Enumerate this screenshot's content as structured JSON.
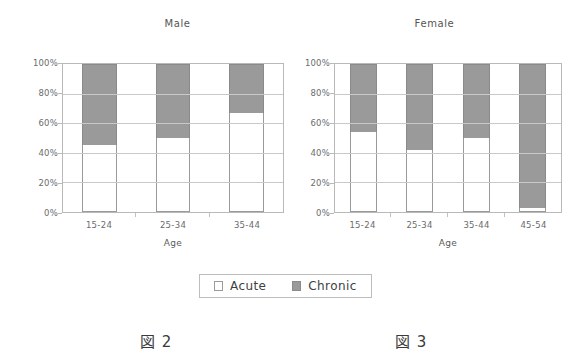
{
  "figure": {
    "captions": [
      {
        "id": "fig2",
        "text": "図 2"
      },
      {
        "id": "fig3",
        "text": "図 3"
      }
    ]
  },
  "legend": {
    "items": [
      {
        "label": "Acute",
        "color": "#ffffff",
        "swatch": "acute-swatch"
      },
      {
        "label": "Chronic",
        "color": "#9a9a9a",
        "swatch": "chronic-swatch"
      }
    ]
  },
  "chart_data": [
    {
      "type": "bar",
      "subtype": "stacked-100-percent",
      "title": "Male",
      "xlabel": "Age",
      "ylabel": "",
      "categories": [
        "15-24",
        "25-34",
        "35-44"
      ],
      "ytick_labels": [
        "0%",
        "20%",
        "40%",
        "60%",
        "80%",
        "100%"
      ],
      "ytick_values": [
        0,
        20,
        40,
        60,
        80,
        100
      ],
      "ylim": [
        0,
        100
      ],
      "grid": true,
      "legend_position": "bottom-center-shared",
      "series": [
        {
          "name": "Acute",
          "color": "#ffffff",
          "values": [
            45,
            50,
            67
          ]
        },
        {
          "name": "Chronic",
          "color": "#9a9a9a",
          "values": [
            55,
            50,
            33
          ]
        }
      ]
    },
    {
      "type": "bar",
      "subtype": "stacked-100-percent",
      "title": "Female",
      "xlabel": "Age",
      "ylabel": "",
      "categories": [
        "15-24",
        "25-34",
        "35-44",
        "45-54"
      ],
      "ytick_labels": [
        "0%",
        "20%",
        "40%",
        "60%",
        "80%",
        "100%"
      ],
      "ytick_values": [
        0,
        20,
        40,
        60,
        80,
        100
      ],
      "ylim": [
        0,
        100
      ],
      "grid": true,
      "legend_position": "bottom-center-shared",
      "series": [
        {
          "name": "Acute",
          "color": "#ffffff",
          "values": [
            54,
            42,
            50,
            3
          ]
        },
        {
          "name": "Chronic",
          "color": "#9a9a9a",
          "values": [
            46,
            58,
            50,
            97
          ]
        }
      ]
    }
  ]
}
